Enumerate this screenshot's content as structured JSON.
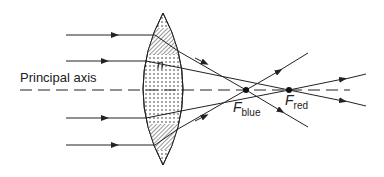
{
  "diagram": {
    "labels": {
      "principal_axis": "Principal axis",
      "refractive_index": "n",
      "f_blue_main": "F",
      "f_blue_sub": "blue",
      "f_red_main": "F",
      "f_red_sub": "red"
    },
    "colors": {
      "line": "#222222",
      "lens_fill": "#ffffff",
      "dots": "#333333"
    },
    "elements": {
      "lens": {
        "center_x": 163,
        "top_y": 13,
        "bottom_y": 165,
        "half_width": 20
      },
      "principal_axis_y": 90,
      "focal_points": [
        {
          "name": "F_blue",
          "x": 246,
          "y": 90
        },
        {
          "name": "F_red",
          "x": 289,
          "y": 90
        }
      ],
      "incident_rays_y": [
        35,
        61,
        118,
        145
      ]
    }
  }
}
